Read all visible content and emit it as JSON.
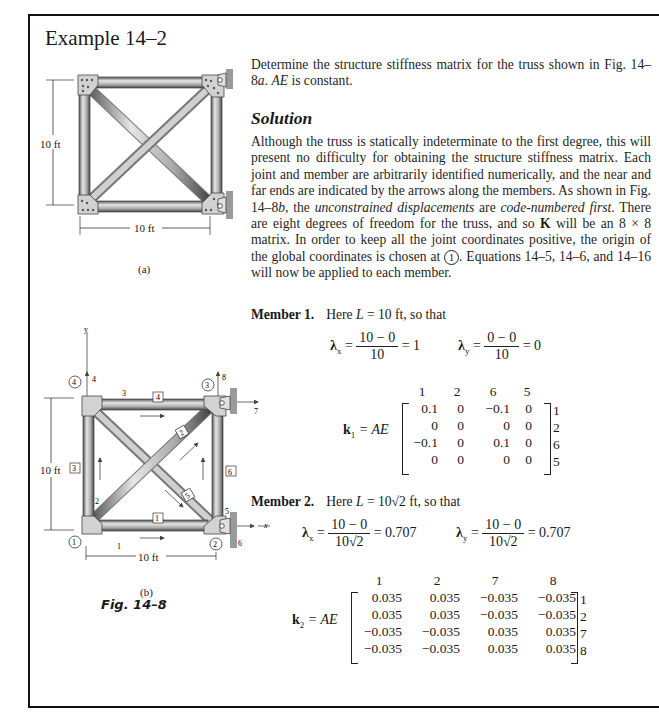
{
  "title": "Example 14–2",
  "intro": {
    "text_before_italic": "Determine the structure stiffness matrix for the truss shown in Fig. 14–8",
    "italic_a": "a",
    "text_mid": ". ",
    "italic_ae": "AE",
    "text_end": " is constant."
  },
  "solution": {
    "heading": "Solution",
    "p1": "Although the truss is statically indeterminate to the first degree, this will present no difficulty for obtaining the structure stiffness matrix. Each joint and member are arbitrarily identified numerically, and the near and far ends are indicated by the arrows along the members. As shown in Fig. 14–8",
    "p1_italic_b": "b",
    "p1_b": ", the ",
    "p1_italic_1": "unconstrained displacements",
    "p1_c": " are ",
    "p1_italic_2": "code-numbered first",
    "p1_d": ". There are eight degrees of freedom for the truss, and so ",
    "p1_bold_K": "K",
    "p1_e": " will be an 8 × 8 matrix. In order to keep all the joint coordinates positive, the origin of the global coordinates is chosen at ",
    "p1_circle": "1",
    "p1_f": ". Equations 14–5, 14–6, and 14–16 will now be applied to each member."
  },
  "member1": {
    "heading": "Member 1.",
    "text_a": "Here ",
    "L": "L",
    "text_b": " = 10 ft, so that",
    "lambda_x": {
      "label": "λ",
      "sub": "x",
      "num": "10 − 0",
      "den": "10",
      "result": "= 1"
    },
    "lambda_y": {
      "label": "λ",
      "sub": "y",
      "num": "0 − 0",
      "den": "10",
      "result": "= 0"
    },
    "k_label": "k",
    "k_sub": "1",
    "k_eq": " = AE",
    "col_headers": [
      "1",
      "2",
      "6",
      "5"
    ],
    "rows": [
      [
        "0.1",
        "0",
        "−0.1",
        "0"
      ],
      [
        "0",
        "0",
        "0",
        "0"
      ],
      [
        "−0.1",
        "0",
        "0.1",
        "0"
      ],
      [
        "0",
        "0",
        "0",
        "0"
      ]
    ],
    "row_labels": [
      "1",
      "2",
      "6",
      "5"
    ]
  },
  "member2": {
    "heading": "Member 2.",
    "text_a": "Here ",
    "L": "L",
    "text_b": " = 10√2 ft, so that",
    "lambda_x": {
      "label": "λ",
      "sub": "x",
      "num": "10 − 0",
      "den": "10√2",
      "result": "= 0.707"
    },
    "lambda_y": {
      "label": "λ",
      "sub": "y",
      "num": "10 − 0",
      "den": "10√2",
      "result": "= 0.707"
    },
    "k_label": "k",
    "k_sub": "2",
    "k_eq": " = AE",
    "col_headers": [
      "1",
      "2",
      "7",
      "8"
    ],
    "rows": [
      [
        "0.035",
        "0.035",
        "−0.035",
        "−0.035"
      ],
      [
        "0.035",
        "0.035",
        "−0.035",
        "−0.035"
      ],
      [
        "−0.035",
        "−0.035",
        "0.035",
        "0.035"
      ],
      [
        "−0.035",
        "−0.035",
        "0.035",
        "0.035"
      ]
    ],
    "row_labels": [
      "1",
      "2",
      "7",
      "8"
    ]
  },
  "figure_a": {
    "dim_vertical": "10 ft",
    "dim_horizontal": "10 ft",
    "caption": "(a)"
  },
  "figure_b": {
    "axis_y": "y",
    "axis_x": "x",
    "dim_vertical": "10 ft",
    "dim_horizontal": "10 ft",
    "caption": "(b)",
    "joints": [
      "1",
      "2",
      "3",
      "4"
    ],
    "members": [
      "1",
      "2",
      "3",
      "4",
      "5",
      "6"
    ],
    "dof": [
      "1",
      "2",
      "3",
      "4",
      "5",
      "6",
      "7",
      "8"
    ]
  },
  "figure_caption": "Fig. 14–8",
  "colors": {
    "frame": "#111111",
    "steel_light": "#d8d8d8",
    "steel_dark": "#6e6e6e",
    "gusset": "#cfcfcf",
    "wall": "#9a9a9a",
    "text": "#1f1f1f"
  }
}
